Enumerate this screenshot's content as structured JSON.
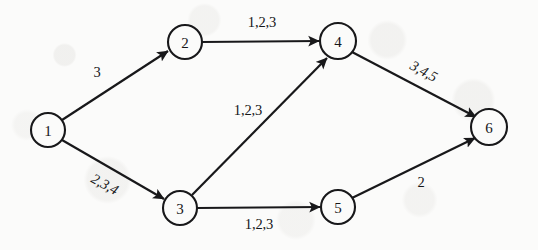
{
  "figure": {
    "kind": "directed-graph-diagram",
    "background_color": "#fbfbfa",
    "ink_color": "#18181a",
    "width": 538,
    "height": 250
  },
  "nodes": [
    {
      "id": "1",
      "label": "1",
      "cx": 48,
      "cy": 130,
      "r": 17
    },
    {
      "id": "2",
      "label": "2",
      "cx": 185,
      "cy": 42,
      "r": 17
    },
    {
      "id": "3",
      "label": "3",
      "cx": 180,
      "cy": 208,
      "r": 17
    },
    {
      "id": "4",
      "label": "4",
      "cx": 338,
      "cy": 41,
      "r": 18
    },
    {
      "id": "5",
      "label": "5",
      "cx": 338,
      "cy": 207,
      "r": 17
    },
    {
      "id": "6",
      "label": "6",
      "cx": 489,
      "cy": 127,
      "r": 18
    }
  ],
  "edges": [
    {
      "id": "e1-2",
      "from": "1",
      "to": "2",
      "label": "3",
      "label_x": 97,
      "label_y": 72,
      "label_rotation": 0
    },
    {
      "id": "e1-3",
      "from": "1",
      "to": "3",
      "label": "2,3,4",
      "label_x": 105,
      "label_y": 184,
      "label_rotation": 29
    },
    {
      "id": "e2-4",
      "from": "2",
      "to": "4",
      "label": "1,2,3",
      "label_x": 262,
      "label_y": 22,
      "label_rotation": 0
    },
    {
      "id": "e3-4",
      "from": "3",
      "to": "4",
      "label": "1,2,3",
      "label_x": 248,
      "label_y": 110,
      "label_rotation": 0
    },
    {
      "id": "e3-5",
      "from": "3",
      "to": "5",
      "label": "1,2,3",
      "label_x": 259,
      "label_y": 224,
      "label_rotation": 0
    },
    {
      "id": "e4-6",
      "from": "4",
      "to": "6",
      "label": "3,4,5",
      "label_x": 424,
      "label_y": 71,
      "label_rotation": 29
    },
    {
      "id": "e5-6",
      "from": "5",
      "to": "6",
      "label": "2",
      "label_x": 421,
      "label_y": 182,
      "label_rotation": 0
    }
  ]
}
